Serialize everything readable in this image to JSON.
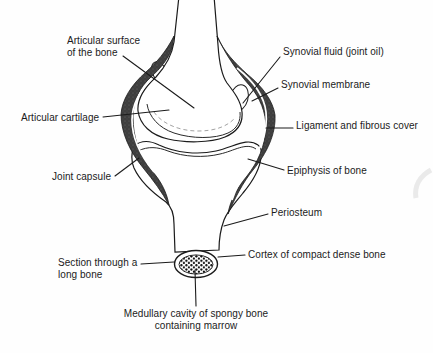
{
  "figure": {
    "type": "anatomical-diagram",
    "colors": {
      "ink": "#1b1b1b",
      "bone_fill": "#ffffff",
      "capsule_fill": "#3e3e3e",
      "background": "#fefefe"
    },
    "labels": {
      "articular_surface": {
        "text": "Articular surface\nof the bone"
      },
      "synovial_fluid": {
        "text": "Synovial fluid (joint oil)"
      },
      "synovial_membrane": {
        "text": "Synovial membrane"
      },
      "articular_cartilage": {
        "text": "Articular cartilage"
      },
      "ligament": {
        "text": "Ligament and fibrous cover"
      },
      "joint_capsule": {
        "text": "Joint capsule"
      },
      "epiphysis": {
        "text": "Epiphysis of bone"
      },
      "periosteum": {
        "text": "Periosteum"
      },
      "section": {
        "text": "Section through a\nlong bone"
      },
      "cortex": {
        "text": "Cortex of compact dense bone"
      },
      "medullary": {
        "text": "Medullary cavity of spongy bone\ncontaining marrow"
      }
    }
  }
}
